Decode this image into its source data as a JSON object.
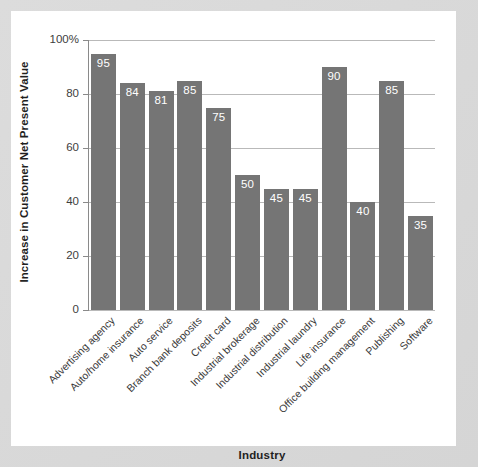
{
  "chart_data": {
    "type": "bar",
    "title": "",
    "xlabel": "Industry",
    "ylabel": "Increase in Customer Net Present Value",
    "categories": [
      "Advertising agency",
      "Auto/home insurance",
      "Auto service",
      "Branch bank deposits",
      "Credit card",
      "Industrial brokerage",
      "Industrial distribution",
      "Industrial laundry",
      "Life insurance",
      "Office building management",
      "Publishing",
      "Software"
    ],
    "values": [
      95,
      84,
      81,
      85,
      75,
      50,
      45,
      45,
      90,
      40,
      85,
      35
    ],
    "value_labels": [
      "95",
      "84",
      "81",
      "85",
      "75",
      "50",
      "45",
      "45",
      "90",
      "40",
      "85",
      "35"
    ],
    "ylim": [
      0,
      100
    ],
    "ytick_values": [
      100,
      80,
      60,
      40,
      20,
      0
    ],
    "ytick_labels": [
      "100%",
      "80",
      "60",
      "40",
      "20",
      "0"
    ],
    "grid": "horizontal",
    "legend": "none",
    "bar_color": "#757575",
    "value_label_color": "#ffffff",
    "gridline_color": "#b9b9b9",
    "plot_background": "#ffffff",
    "page_background": "#d8d8d8"
  }
}
